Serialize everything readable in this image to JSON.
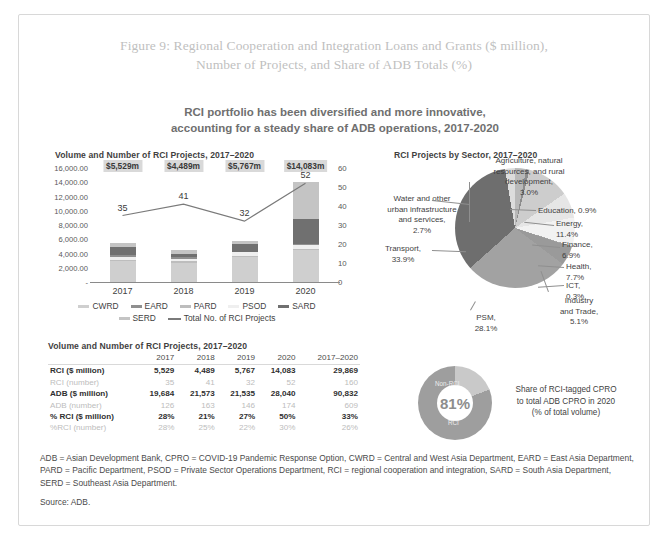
{
  "figure": {
    "title_line1": "Figure 9: Regional Cooperation and Integration Loans and Grants ($ million),",
    "title_line2": "Number of Projects, and Share of ADB Totals (%)",
    "subtitle_line1": "RCI portfolio has been diversified and more innovative,",
    "subtitle_line2": "accounting for a steady share of ADB operations, 2017-2020",
    "notes": "ADB = Asian Development Bank, CPRO = COVID-19 Pandemic Response Option, CWRD = Central and West Asia Department, EARD = East Asia Department, PARD = Pacific Department, PSOD = Private Sector Operations Department, RCI = regional cooperation and integration, SARD = South Asia Department, SERD = Southeast Asia Department.",
    "source": "Source: ADB."
  },
  "bar_panel": {
    "title": "Volume and Number of RCI Projects, 2017–2020"
  },
  "pie_panel": {
    "title": "RCI Projects by Sector, 2017–2020"
  },
  "table_panel": {
    "title": "Volume and Number of RCI Projects, 2017–2020"
  },
  "chart_data": [
    {
      "type": "bar",
      "id": "volume-and-projects",
      "title": "Volume and Number of RCI Projects, 2017–2020",
      "categories": [
        "2017",
        "2018",
        "2019",
        "2020"
      ],
      "ylabel": "",
      "xlabel": "",
      "ylim": [
        0,
        16000
      ],
      "y_ticks": [
        "-",
        "2,000.00",
        "4,000.00",
        "6,000.00",
        "8,000.00",
        "10,000.00",
        "12,000.00",
        "14,000.00",
        "16,000.00"
      ],
      "y2lim": [
        0,
        60
      ],
      "y2_ticks": [
        "0",
        "10",
        "20",
        "30",
        "40",
        "50",
        "60"
      ],
      "grid": false,
      "legend_position": "bottom",
      "series": [
        {
          "name": "CWRD",
          "color": "#cfcfcf",
          "values": [
            2950,
            2700,
            3450,
            4500
          ]
        },
        {
          "name": "EARD",
          "color": "#8f8f8f",
          "values": [
            260,
            320,
            120,
            160
          ]
        },
        {
          "name": "PARD",
          "color": "#bdbdbd",
          "values": [
            200,
            180,
            200,
            180
          ]
        },
        {
          "name": "PSOD",
          "color": "#efefef",
          "values": [
            420,
            300,
            500,
            480
          ]
        },
        {
          "name": "SARD",
          "color": "#707070",
          "values": [
            1100,
            450,
            1100,
            3500
          ]
        },
        {
          "name": "SERD",
          "color": "#c4c4c4",
          "values": [
            600,
            540,
            400,
            5260
          ]
        }
      ],
      "bar_totals": [
        5529,
        4489,
        5767,
        14083
      ],
      "bar_total_labels": [
        "$5,529m",
        "$4,489m",
        "$5,767m",
        "$14,083m"
      ],
      "line_series": {
        "name": "Total No. of RCI Projects",
        "color": "#7a7a7a",
        "values": [
          35,
          41,
          32,
          52
        ],
        "axis": "secondary"
      }
    },
    {
      "type": "pie",
      "id": "rci-projects-by-sector",
      "title": "RCI Projects by Sector, 2017–2020",
      "labels": [
        "Agriculture, natural resources, and rural development",
        "Education",
        "Energy",
        "Finance",
        "Health",
        "ICT",
        "Industry and Trade",
        "PSM",
        "Transport",
        "Water and other urban infrastructure and services"
      ],
      "values": [
        3.0,
        0.9,
        11.4,
        6.9,
        7.7,
        0.3,
        5.1,
        28.1,
        33.9,
        2.7
      ],
      "value_labels": [
        "3.0%",
        "0.9%",
        "11.4%",
        "6.9%",
        "7.7%",
        "0.3%",
        "5.1%",
        "28.1%",
        "33.9%",
        "2.7%"
      ],
      "colors": [
        "#b9b9b9",
        "#8c8c8c",
        "#cdcdcd",
        "#e6e6e6",
        "#f2f2f2",
        "#a6a6a6",
        "#9a9a9a",
        "#a2a2a2",
        "#6e6e6e",
        "#dcdcdc"
      ]
    },
    {
      "type": "pie",
      "id": "cpro-share-donut",
      "title": "Share of RCI-tagged CPRO to total ADB CPRO in 2020 (% of total volume)",
      "labels": [
        "RCI",
        "Non-RCI"
      ],
      "values": [
        81,
        19
      ],
      "center_label": "81%",
      "colors": [
        "#9e9e9e",
        "#c9c9c9"
      ]
    }
  ],
  "bar_labels": {
    "annotations_value": [
      "$5,529m",
      "$4,489m",
      "$5,767m",
      "$14,083m"
    ],
    "annotations_projects": [
      "35",
      "41",
      "32",
      "52"
    ],
    "x_ticks": [
      "2017",
      "2018",
      "2019",
      "2020"
    ],
    "y_ticks": [
      "16,000.00",
      "14,000.00",
      "12,000.00",
      "10,000.00",
      "8,000.00",
      "6,000.00",
      "4,000.00",
      "2,000.00",
      "-"
    ],
    "y2_ticks": [
      "60",
      "50",
      "40",
      "30",
      "20",
      "10",
      "0"
    ],
    "legend_row1": [
      "CWRD",
      "EARD",
      "PARD",
      "PSOD",
      "SARD"
    ],
    "legend_row2": [
      "SERD",
      "Total No. of RCI Projects"
    ]
  },
  "pie_labels": [
    {
      "text": "Agriculture, natural\nresources, and rural\ndevelopment,\n3.0%"
    },
    {
      "text": "Education, 0.9%"
    },
    {
      "text": "Energy,\n11.4%"
    },
    {
      "text": "Finance,\n6.9%"
    },
    {
      "text": "Health,\n7.7%"
    },
    {
      "text": "ICT,\n0.3%"
    },
    {
      "text": "Industry\nand Trade,\n5.1%"
    },
    {
      "text": "PSM,\n28.1%"
    },
    {
      "text": "Transport,\n33.9%"
    },
    {
      "text": "Water and other\nurban infrastructure\nand services,\n2.7%"
    }
  ],
  "table": {
    "columns": [
      "",
      "2017",
      "2018",
      "2019",
      "2020",
      "2017–2020"
    ],
    "rows": [
      {
        "label": "RCI ($ million)",
        "style": "strong",
        "values": [
          "5,529",
          "4,489",
          "5,767",
          "14,083",
          "29,869"
        ]
      },
      {
        "label": "RCI (number)",
        "style": "faint",
        "values": [
          "35",
          "41",
          "32",
          "52",
          "160"
        ]
      },
      {
        "label": "ADB ($ million)",
        "style": "strong",
        "values": [
          "19,684",
          "21,573",
          "21,535",
          "28,040",
          "90,832"
        ]
      },
      {
        "label": "ADB (number)",
        "style": "faint",
        "values": [
          "126",
          "163",
          "146",
          "174",
          "609"
        ]
      },
      {
        "label": "% RCI ($ million)",
        "style": "strong",
        "values": [
          "28%",
          "21%",
          "27%",
          "50%",
          "33%"
        ]
      },
      {
        "label": "%RCI (number)",
        "style": "faint",
        "values": [
          "28%",
          "25%",
          "22%",
          "30%",
          "26%"
        ]
      }
    ]
  },
  "donut": {
    "center": "81%",
    "label_top": "Non-RCI",
    "label_bottom": "RCI",
    "caption_line1": "Share of RCI-tagged CPRO",
    "caption_line2": "to total ADB CPRO in 2020",
    "caption_line3": "(% of total volume)"
  }
}
